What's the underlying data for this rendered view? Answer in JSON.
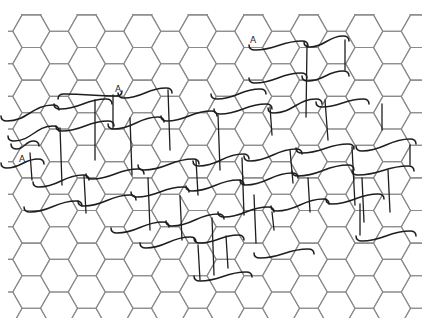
{
  "diagram": {
    "width": 437,
    "height": 326,
    "background": "#ffffff",
    "grid": {
      "type": "hexagonal-flat-top",
      "side": 18.5,
      "col_period": 55.5,
      "row_height": 32.6,
      "origin_x": 59,
      "origin_y": 47.5,
      "offset_col_origin_x": 31.3,
      "offset_col_origin_y": 63.8,
      "color": "#8a8a8a",
      "y_min": 14,
      "y_max": 318,
      "x_min": 8,
      "x_max": 422
    },
    "stroke_color": "#1e1e1e",
    "s_curves": [
      [
        253,
        49,
        304,
        42
      ],
      [
        308,
        46,
        345,
        37
      ],
      [
        118,
        95,
        62,
        95
      ],
      [
        122,
        97,
        168,
        89
      ],
      [
        5,
        120,
        55,
        106
      ],
      [
        58,
        108,
        108,
        100
      ],
      [
        253,
        82,
        303,
        74
      ],
      [
        306,
        80,
        345,
        72
      ],
      [
        215,
        98,
        262,
        90
      ],
      [
        12,
        140,
        55,
        127
      ],
      [
        60,
        130,
        110,
        122
      ],
      [
        112,
        128,
        160,
        118
      ],
      [
        165,
        120,
        213,
        112
      ],
      [
        218,
        113,
        268,
        105
      ],
      [
        272,
        112,
        318,
        100
      ],
      [
        320,
        106,
        365,
        100
      ],
      [
        15,
        148,
        35,
        142
      ],
      [
        5,
        167,
        40,
        160
      ],
      [
        37,
        186,
        85,
        176
      ],
      [
        90,
        178,
        140,
        170
      ],
      [
        142,
        169,
        195,
        160
      ],
      [
        197,
        165,
        245,
        155
      ],
      [
        248,
        160,
        298,
        150
      ],
      [
        300,
        152,
        350,
        145
      ],
      [
        360,
        150,
        412,
        140
      ],
      [
        28,
        211,
        78,
        202
      ],
      [
        82,
        205,
        132,
        196
      ],
      [
        135,
        196,
        185,
        188
      ],
      [
        190,
        190,
        240,
        181
      ],
      [
        244,
        184,
        294,
        174
      ],
      [
        296,
        175,
        350,
        166
      ],
      [
        356,
        174,
        410,
        167
      ],
      [
        115,
        232,
        165,
        223
      ],
      [
        170,
        225,
        220,
        215
      ],
      [
        222,
        216,
        270,
        208
      ],
      [
        275,
        210,
        325,
        200
      ],
      [
        330,
        203,
        380,
        195
      ],
      [
        360,
        240,
        412,
        232
      ],
      [
        144,
        247,
        192,
        238
      ],
      [
        198,
        242,
        240,
        236
      ],
      [
        258,
        257,
        310,
        250
      ],
      [
        198,
        280,
        248,
        273
      ]
    ],
    "v_lines": [
      [
        307,
        45,
        306,
        117
      ],
      [
        345,
        40,
        345,
        70
      ],
      [
        113,
        95,
        113,
        128
      ],
      [
        95,
        100,
        95,
        160
      ],
      [
        168,
        90,
        170,
        150
      ],
      [
        30,
        153,
        32,
        180
      ],
      [
        60,
        128,
        62,
        185
      ],
      [
        130,
        118,
        132,
        175
      ],
      [
        218,
        115,
        220,
        170
      ],
      [
        270,
        107,
        272,
        135
      ],
      [
        325,
        100,
        328,
        140
      ],
      [
        382,
        104,
        382,
        130
      ],
      [
        84,
        176,
        86,
        213
      ],
      [
        148,
        178,
        150,
        230
      ],
      [
        196,
        160,
        198,
        195
      ],
      [
        242,
        158,
        244,
        215
      ],
      [
        290,
        150,
        293,
        183
      ],
      [
        352,
        147,
        355,
        205
      ],
      [
        410,
        145,
        410,
        165
      ],
      [
        180,
        196,
        182,
        240
      ],
      [
        254,
        195,
        256,
        243
      ],
      [
        308,
        178,
        310,
        212
      ],
      [
        362,
        178,
        364,
        222
      ],
      [
        212,
        218,
        214,
        275
      ],
      [
        272,
        212,
        274,
        230
      ],
      [
        198,
        245,
        200,
        280
      ],
      [
        226,
        236,
        228,
        268
      ],
      [
        360,
        204,
        360,
        235
      ],
      [
        388,
        170,
        390,
        212
      ]
    ],
    "labels": [
      {
        "text": "A",
        "x": 250,
        "y": 43
      },
      {
        "text": "A",
        "x": 115,
        "y": 92
      },
      {
        "text": "A",
        "x": 19,
        "y": 162
      }
    ]
  }
}
